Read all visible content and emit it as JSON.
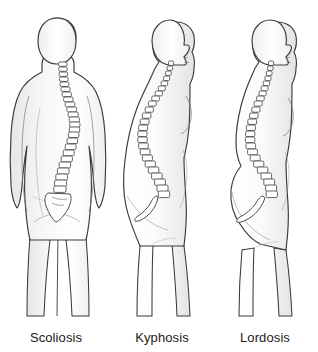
{
  "illustration": {
    "title": "Spinal curvature conditions",
    "view_count": 3,
    "background_color": "#ffffff",
    "outline_color": "#3a3a3a",
    "body_fill_color": "#fdfdfd",
    "shading_color": "#e8e8e8",
    "vertebra_fill_color": "#ffffff",
    "vertebra_outline_color": "#4a4a4a",
    "label_color": "#1b1b1b"
  },
  "figures": [
    {
      "id": "scoliosis",
      "label": "Scoliosis",
      "view": "posterior",
      "orientation": "back view, facing away",
      "spine_description": "lateral S-shaped sideways curvature of the spine",
      "sacrum_visible": true,
      "center_x": 57
    },
    {
      "id": "kyphosis",
      "label": "Kyphosis",
      "view": "lateral",
      "orientation": "side view, facing right",
      "spine_description": "exaggerated outward rounding of the upper back (hunchback)",
      "sacrum_visible": true,
      "center_x": 165
    },
    {
      "id": "lordosis",
      "label": "Lordosis",
      "view": "lateral",
      "orientation": "side view, facing right",
      "spine_description": "exaggerated inward curve of the lower back (swayback)",
      "sacrum_visible": true,
      "center_x": 265
    }
  ],
  "captions": {
    "scoliosis": "Scoliosis",
    "kyphosis": "Kyphosis",
    "lordosis": "Lordosis"
  }
}
